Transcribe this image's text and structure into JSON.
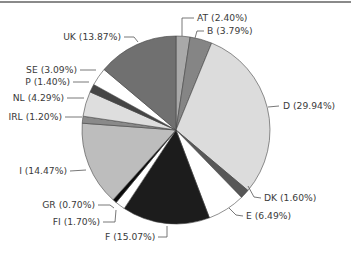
{
  "chart_data": {
    "type": "pie",
    "title": "",
    "start_angle_deg": 0,
    "direction": "clockwise",
    "slices": [
      {
        "label": "AT",
        "value": 2.4,
        "text": "AT (2.40%)",
        "color": "#a9a9a9"
      },
      {
        "label": "B",
        "value": 3.79,
        "text": "B (3.79%)",
        "color": "#858585"
      },
      {
        "label": "D",
        "value": 29.94,
        "text": "D (29.94%)",
        "color": "#dcdcdc"
      },
      {
        "label": "DK",
        "value": 1.6,
        "text": "DK (1.60%)",
        "color": "#575757"
      },
      {
        "label": "E",
        "value": 6.49,
        "text": "E (6.49%)",
        "color": "#ffffff"
      },
      {
        "label": "F",
        "value": 15.07,
        "text": "F (15.07%)",
        "color": "#1c1c1c"
      },
      {
        "label": "FI",
        "value": 1.7,
        "text": "FI (1.70%)",
        "color": "#ffffff"
      },
      {
        "label": "GR",
        "value": 0.7,
        "text": "GR (0.70%)",
        "color": "#0a0a0a"
      },
      {
        "label": "I",
        "value": 14.47,
        "text": "I (14.47%)",
        "color": "#bdbdbd"
      },
      {
        "label": "IRL",
        "value": 1.2,
        "text": "IRL (1.20%)",
        "color": "#8a8a8a"
      },
      {
        "label": "NL",
        "value": 4.29,
        "text": "NL (4.29%)",
        "color": "#dedede"
      },
      {
        "label": "P",
        "value": 1.4,
        "text": "P (1.40%)",
        "color": "#454545"
      },
      {
        "label": "SE",
        "value": 3.09,
        "text": "SE (3.09%)",
        "color": "#ffffff"
      },
      {
        "label": "UK",
        "value": 13.87,
        "text": "UK (13.87%)",
        "color": "#707070"
      }
    ],
    "legend": "none (direct labels with leader lines)"
  },
  "layout": {
    "cx": 176,
    "cy": 130,
    "r": 94,
    "labels": [
      {
        "x": 197,
        "y": 21,
        "anchor": "start",
        "leader": [
          [
            182,
            36
          ],
          [
            182,
            18
          ],
          [
            194,
            18
          ]
        ]
      },
      {
        "x": 207,
        "y": 34,
        "anchor": "start",
        "leader": [
          [
            195,
            38
          ],
          [
            197,
            31
          ],
          [
            204,
            31
          ]
        ]
      },
      {
        "x": 283,
        "y": 109,
        "anchor": "start",
        "leader": [
          [
            268,
            107
          ],
          [
            279,
            106
          ]
        ]
      },
      {
        "x": 264,
        "y": 201,
        "anchor": "start",
        "leader": [
          [
            248,
            186
          ],
          [
            254,
            197
          ],
          [
            261,
            198
          ]
        ]
      },
      {
        "x": 246,
        "y": 219,
        "anchor": "start",
        "leader": [
          [
            229,
            208
          ],
          [
            236,
            215
          ],
          [
            243,
            216
          ]
        ]
      },
      {
        "x": 105,
        "y": 240,
        "anchor": "start",
        "leader": [
          [
            158,
            237
          ],
          [
            167,
            237
          ],
          [
            167,
            226
          ]
        ]
      },
      {
        "x": 100,
        "y": 225,
        "anchor": "end",
        "leader": [
          [
            103,
            222
          ],
          [
            115,
            222
          ],
          [
            116,
            210
          ]
        ]
      },
      {
        "x": 95,
        "y": 208,
        "anchor": "end",
        "leader": [
          [
            98,
            205
          ],
          [
            110,
            205
          ],
          [
            114,
            208
          ]
        ]
      },
      {
        "x": 67,
        "y": 174,
        "anchor": "end",
        "leader": [
          [
            70,
            171
          ],
          [
            86,
            170
          ]
        ]
      },
      {
        "x": 62,
        "y": 120,
        "anchor": "end",
        "leader": [
          [
            65,
            117
          ],
          [
            82,
            117
          ]
        ]
      },
      {
        "x": 64,
        "y": 101,
        "anchor": "end",
        "leader": [
          [
            67,
            98
          ],
          [
            84,
            98
          ]
        ]
      },
      {
        "x": 70,
        "y": 85,
        "anchor": "end",
        "leader": [
          [
            73,
            82
          ],
          [
            89,
            82
          ]
        ]
      },
      {
        "x": 77,
        "y": 73,
        "anchor": "end",
        "leader": [
          [
            80,
            70
          ],
          [
            96,
            70
          ]
        ]
      },
      {
        "x": 121,
        "y": 40,
        "anchor": "end",
        "leader": [
          [
            124,
            37
          ],
          [
            134,
            37
          ],
          [
            138,
            42
          ]
        ]
      }
    ]
  }
}
